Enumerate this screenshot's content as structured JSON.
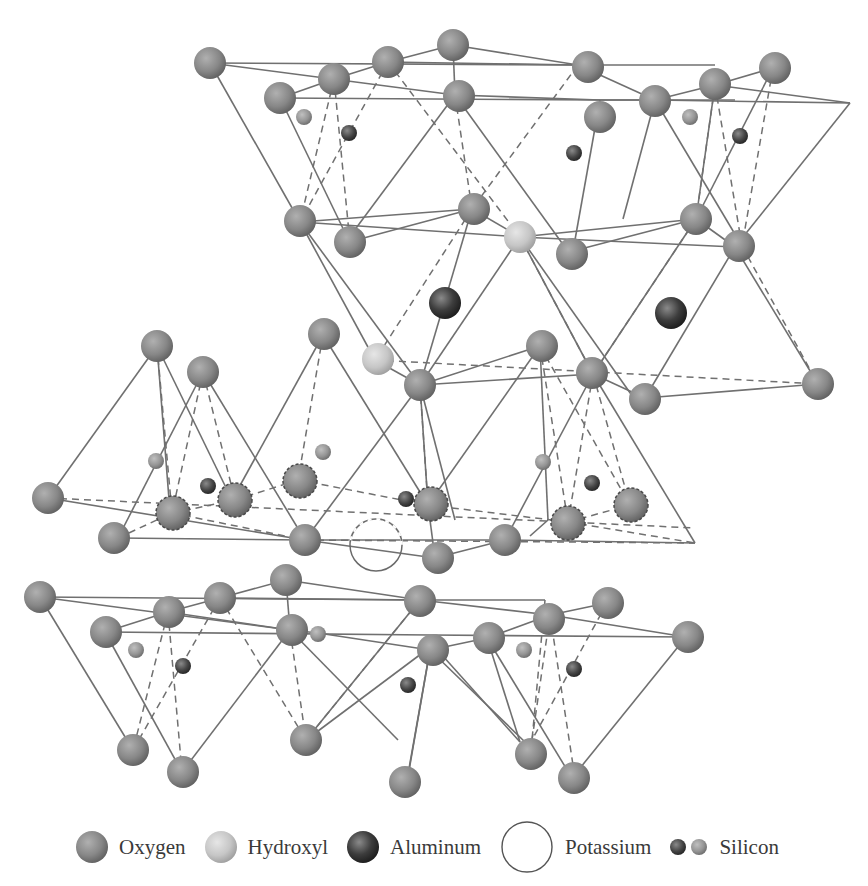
{
  "figure": {
    "colors": {
      "oxygen": "#8a8a8a",
      "hydroxyl": "#c8c8c8",
      "aluminum": "#3a3a3a",
      "silicon_dark": "#4a4a4a",
      "silicon_light": "#9a9a9a",
      "bond_line": "#707070"
    }
  },
  "legend": {
    "items": [
      {
        "label": "Oxygen",
        "icon": "oxygen-sphere"
      },
      {
        "label": "Hydroxyl",
        "icon": "hydroxyl-sphere"
      },
      {
        "label": "Aluminum",
        "icon": "aluminum-sphere"
      },
      {
        "label": "Potassium",
        "icon": "potassium-circle"
      },
      {
        "label": "Silicon",
        "icon": "silicon-spheres"
      }
    ]
  }
}
